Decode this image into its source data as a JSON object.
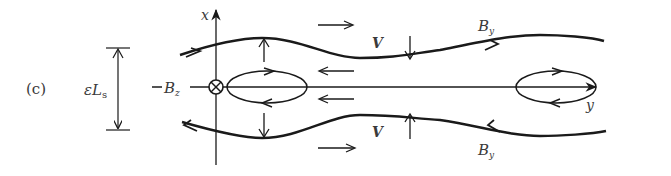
{
  "figure": {
    "panel_label": "(c)",
    "width_label": {
      "main": "εL",
      "sub": "s"
    },
    "bz_label": {
      "main": "B",
      "sub": "z"
    },
    "axes": {
      "x_label": "x",
      "y_label": "y"
    },
    "field_labels": {
      "top_by": {
        "main": "B",
        "sub": "y"
      },
      "bottom_by": {
        "main": "B",
        "sub": "y"
      }
    },
    "velocity_labels": {
      "top": "V",
      "bottom": "V"
    },
    "colors": {
      "ink": "#1a1a1a",
      "label": "#3a3a3a",
      "background": "#ffffff"
    }
  }
}
